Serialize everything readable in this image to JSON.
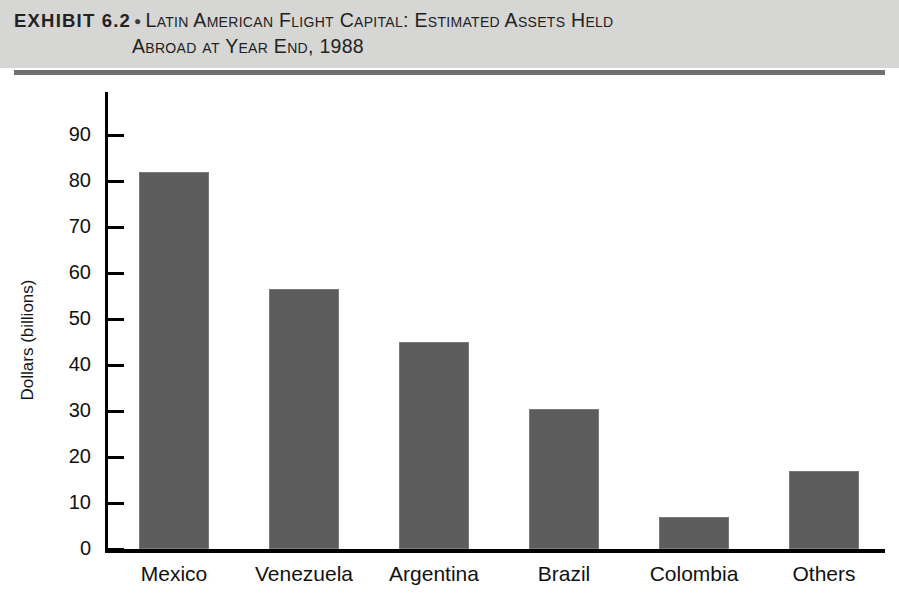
{
  "header": {
    "exhibit_label": "EXHIBIT 6.2",
    "bullet": "●",
    "title_line1": "Latin American Flight Capital: Estimated Assets Held",
    "title_line2": "Abroad at Year End, 1988"
  },
  "colors": {
    "header_band": "#d6d6d4",
    "header_rule": "#6f6f6f",
    "bar_fill": "#5d5d5d",
    "axis": "#000000",
    "text": "#111111"
  },
  "chart_data": {
    "type": "bar",
    "title": "Latin American Flight Capital: Estimated Assets Held Abroad at Year End, 1988",
    "xlabel": "",
    "ylabel": "Dollars (billions)",
    "categories": [
      "Mexico",
      "Venezuela",
      "Argentina",
      "Brazil",
      "Colombia",
      "Others"
    ],
    "values": [
      82,
      56.5,
      45,
      30.5,
      7,
      17
    ],
    "ylim": [
      0,
      95
    ],
    "yticks": [
      0,
      10,
      20,
      30,
      40,
      50,
      60,
      70,
      80,
      90
    ],
    "ytick_labels": [
      "0",
      "10",
      "20",
      "30",
      "40",
      "50",
      "60",
      "70",
      "80",
      "90"
    ],
    "grid": false,
    "legend": false,
    "series": [
      {
        "name": "Estimated assets held abroad",
        "values": [
          82,
          56.5,
          45,
          30.5,
          7,
          17
        ]
      }
    ]
  }
}
